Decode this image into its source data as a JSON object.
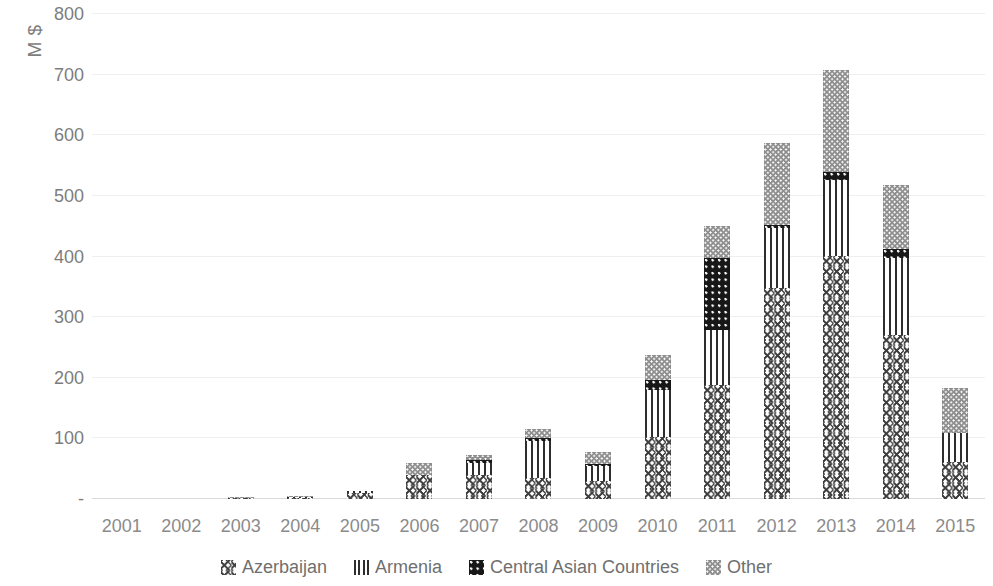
{
  "chart_data": {
    "type": "bar",
    "stacked": true,
    "title": "",
    "xlabel": "",
    "ylabel": "M $",
    "ylim": [
      0,
      800
    ],
    "yticks": [
      "800",
      "700",
      "600",
      "500",
      "400",
      "300",
      "200",
      "100",
      "-"
    ],
    "ytick_values": [
      800,
      700,
      600,
      500,
      400,
      300,
      200,
      100,
      0
    ],
    "grid": true,
    "legend_position": "bottom",
    "categories": [
      "2001",
      "2002",
      "2003",
      "2004",
      "2005",
      "2006",
      "2007",
      "2008",
      "2009",
      "2010",
      "2011",
      "2012",
      "2013",
      "2014",
      "2015"
    ],
    "series": [
      {
        "name": "Azerbaijan",
        "pattern": "zigzag",
        "color": "#3d3d3d",
        "values": [
          0,
          0,
          1,
          2,
          10,
          40,
          40,
          35,
          30,
          102,
          188,
          348,
          401,
          270,
          61
        ]
      },
      {
        "name": "Armenia",
        "pattern": "vertical-lines",
        "color": "#2e2e2e",
        "values": [
          0,
          0,
          0,
          1,
          3,
          0,
          20,
          60,
          25,
          78,
          91,
          99,
          125,
          128,
          48
        ]
      },
      {
        "name": "Central Asian Countries",
        "pattern": "dark-dotted",
        "color": "#171717",
        "values": [
          0,
          0,
          0,
          0,
          0,
          0,
          5,
          5,
          3,
          16,
          119,
          5,
          14,
          15,
          0
        ]
      },
      {
        "name": "Other",
        "pattern": "gray-stipple",
        "color": "#8d8d8d",
        "values": [
          0,
          0,
          1,
          1,
          0,
          20,
          8,
          15,
          20,
          42,
          52,
          136,
          167,
          105,
          74
        ]
      }
    ],
    "totals": [
      0,
      0,
      2,
      4,
      13,
      60,
      73,
      115,
      78,
      238,
      450,
      588,
      707,
      518,
      183
    ]
  },
  "axis": {
    "y_title": "M $"
  },
  "legend": {
    "items": [
      {
        "label": "Azerbaijan"
      },
      {
        "label": "Armenia"
      },
      {
        "label": "Central Asian Countries"
      },
      {
        "label": "Other"
      }
    ]
  }
}
